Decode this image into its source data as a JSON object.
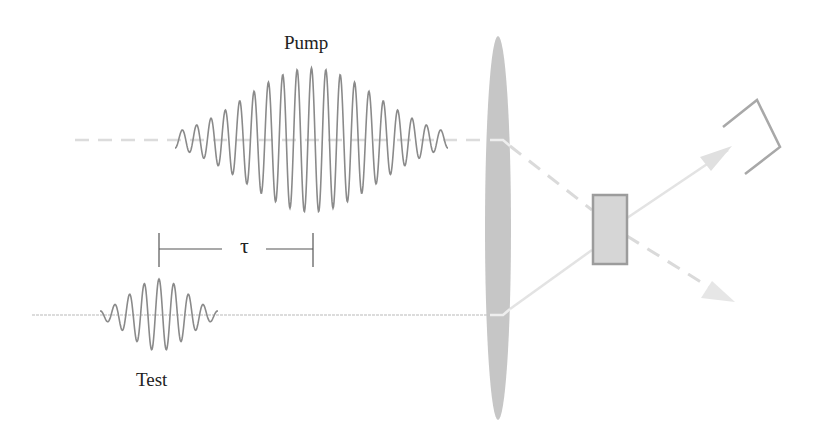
{
  "diagram": {
    "labels": {
      "pump": "Pump",
      "test": "Test",
      "delay": "τ"
    },
    "pulses": [
      {
        "name": "pump",
        "relative_amplitude": 1.0,
        "relative_duration": "long",
        "cycles_visible": 19
      },
      {
        "name": "test",
        "relative_amplitude": 0.5,
        "relative_duration": "short",
        "cycles_visible": 8
      }
    ],
    "components": [
      "pump-beam",
      "test-beam",
      "focusing-lens",
      "sample-crystal",
      "detector",
      "transmitted-test-arrow",
      "transmitted-pump-arrow"
    ],
    "colors": {
      "wave": "#8a8a8a",
      "beam": "#d9d9d9",
      "lens": "#c4c4c4",
      "crystal_fill": "#d6d6d6",
      "crystal_border": "#9a9a9a",
      "detector": "#a8a8a8",
      "text": "#222222"
    }
  }
}
